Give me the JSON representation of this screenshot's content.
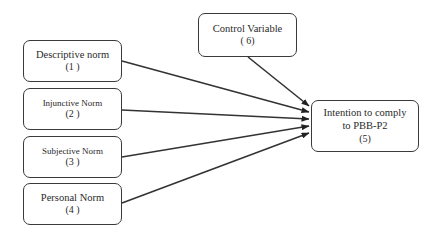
{
  "diagram": {
    "nodes": [
      {
        "id": "1",
        "label": "Descriptive norm",
        "number": "(1 )"
      },
      {
        "id": "2",
        "label": "Injunctive Norm",
        "number": "(2 )"
      },
      {
        "id": "3",
        "label": "Subjective Norm",
        "number": "(3 )"
      },
      {
        "id": "4",
        "label": "Personal Norm",
        "number": "(4 )"
      },
      {
        "id": "5",
        "label_line1": "Intention to comply",
        "label_line2": "to PBB-P2",
        "number": "(5)"
      },
      {
        "id": "6",
        "label": "Control Variable",
        "number": "( 6)"
      }
    ],
    "edges": [
      {
        "from": "1",
        "to": "5"
      },
      {
        "from": "2",
        "to": "5"
      },
      {
        "from": "3",
        "to": "5"
      },
      {
        "from": "4",
        "to": "5"
      },
      {
        "from": "6",
        "to": "5"
      }
    ],
    "colors": {
      "line": "#333333",
      "border": "#3a3a3a",
      "text": "#2a2a2a",
      "background": "#ffffff"
    }
  }
}
